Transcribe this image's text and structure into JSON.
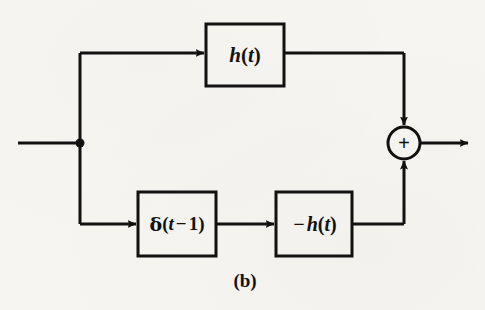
{
  "figure": {
    "caption": "(b)",
    "background_color": "#f6f5f1",
    "stroke_color": "#111111",
    "text_color": "#111111"
  },
  "blocks": {
    "top_filter": {
      "name": "h(t)",
      "label_parts": {
        "var": "h",
        "open": "(",
        "arg": "t",
        "close": ")"
      }
    },
    "delay": {
      "name": "delta(t - 1)",
      "label_parts": {
        "delta": "δ",
        "open": "(",
        "arg": "t",
        "op": "−",
        "num": "1",
        "close": ")"
      }
    },
    "bottom_filter": {
      "name": "-h(t)",
      "label_parts": {
        "sign": "−",
        "var": "h",
        "open": "(",
        "arg": "t",
        "close": ")"
      }
    }
  },
  "summing_junction": {
    "sign": "+",
    "input_top_polarity": "+",
    "input_bottom_polarity": "+"
  },
  "nodes": {
    "input_branch_point": "branch dot"
  },
  "geometry": {
    "canvas": {
      "width": 485,
      "height": 310
    },
    "stroke_width": 3,
    "input_line": {
      "x1": 18,
      "y": 143,
      "x2": 80
    },
    "branch_dot": {
      "cx": 80,
      "cy": 143,
      "r": 4.5
    },
    "top_rail_y": 53,
    "bottom_rail_y": 224,
    "right_rail_x": 404,
    "box_top": {
      "x": 206,
      "y": 24,
      "w": 78,
      "h": 62
    },
    "box_delay": {
      "x": 138,
      "y": 192,
      "w": 78,
      "h": 64
    },
    "box_neg": {
      "x": 276,
      "y": 192,
      "w": 76,
      "h": 64
    },
    "sum_circle": {
      "cx": 404,
      "cy": 143,
      "r": 16
    },
    "output_line": {
      "x1": 420,
      "y": 143,
      "x2": 470
    }
  }
}
